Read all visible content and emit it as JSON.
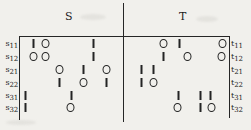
{
  "figure": {
    "headers": [
      {
        "label": "S"
      },
      {
        "label": "T"
      }
    ]
  },
  "chart_data": {
    "type": "table",
    "title": "",
    "xlabel": "",
    "ylabel": "",
    "grid": false,
    "legend": "none",
    "column_groups": [
      "S",
      "T"
    ],
    "row_labels_left": [
      "s11",
      "s12",
      "s21",
      "s22",
      "s31",
      "s32"
    ],
    "row_labels_right": [
      "t11",
      "t12",
      "t21",
      "t22",
      "t31",
      "t32"
    ],
    "symbols": {
      "one": "1",
      "zero": "0"
    },
    "rows": [
      {
        "left": {
          "base": "s",
          "sub": "11"
        },
        "right": {
          "base": "t",
          "sub": "11"
        },
        "y": 43.5,
        "S": [
          {
            "v": "1",
            "x": 33
          },
          {
            "v": "0",
            "x": 45
          },
          {
            "v": "1",
            "x": 93
          }
        ],
        "T": [
          {
            "v": "0",
            "x": 163
          },
          {
            "v": "1",
            "x": 179
          },
          {
            "v": "0",
            "x": 222
          }
        ]
      },
      {
        "left": {
          "base": "s",
          "sub": "12"
        },
        "right": {
          "base": "t",
          "sub": "12"
        },
        "y": 56.5,
        "S": [
          {
            "v": "0",
            "x": 33
          },
          {
            "v": "0",
            "x": 45
          },
          {
            "v": "1",
            "x": 93
          }
        ],
        "T": [
          {
            "v": "1",
            "x": 163
          },
          {
            "v": "0",
            "x": 187
          },
          {
            "v": "0",
            "x": 221
          }
        ]
      },
      {
        "left": {
          "base": "s",
          "sub": "21"
        },
        "right": {
          "base": "t",
          "sub": "21"
        },
        "y": 69.5,
        "S": [
          {
            "v": "0",
            "x": 59
          },
          {
            "v": "1",
            "x": 83
          },
          {
            "v": "0",
            "x": 106
          }
        ],
        "T": [
          {
            "v": "1",
            "x": 141
          },
          {
            "v": "1",
            "x": 153
          }
        ]
      },
      {
        "left": {
          "base": "s",
          "sub": "22"
        },
        "right": {
          "base": "t",
          "sub": "22"
        },
        "y": 82.5,
        "S": [
          {
            "v": "1",
            "x": 59
          },
          {
            "v": "0",
            "x": 83
          },
          {
            "v": "1",
            "x": 106
          }
        ],
        "T": [
          {
            "v": "1",
            "x": 141
          },
          {
            "v": "0",
            "x": 153
          }
        ]
      },
      {
        "left": {
          "base": "s",
          "sub": "31"
        },
        "right": {
          "base": "t",
          "sub": "31"
        },
        "y": 95.5,
        "S": [
          {
            "v": "1",
            "x": 25
          },
          {
            "v": "1",
            "x": 71
          }
        ],
        "T": [
          {
            "v": "1",
            "x": 178
          },
          {
            "v": "1",
            "x": 200
          },
          {
            "v": "1",
            "x": 210
          }
        ]
      },
      {
        "left": {
          "base": "s",
          "sub": "32"
        },
        "right": {
          "base": "t",
          "sub": "32"
        },
        "y": 107.5,
        "S": [
          {
            "v": "1",
            "x": 25
          },
          {
            "v": "0",
            "x": 70
          }
        ],
        "T": [
          {
            "v": "0",
            "x": 177
          },
          {
            "v": "1",
            "x": 200
          },
          {
            "v": "0",
            "x": 211
          }
        ]
      }
    ]
  }
}
